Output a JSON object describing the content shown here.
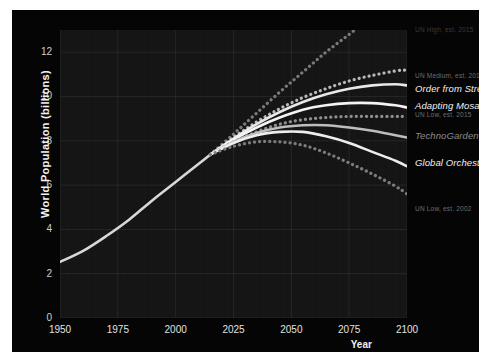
{
  "chart_data": {
    "type": "line",
    "title": "",
    "xlabel": "Year",
    "ylabel": "World Population (billions)",
    "xlim": [
      1950,
      2100
    ],
    "ylim": [
      0,
      13
    ],
    "xticks": [
      1950,
      1975,
      2000,
      2025,
      2050,
      2075,
      2100
    ],
    "yticks": [
      0,
      2,
      4,
      6,
      8,
      10,
      12
    ],
    "grid": true,
    "legend_position": "right-inline-at-line-ends",
    "x": [
      1950,
      1960,
      1970,
      1980,
      1990,
      2000,
      2010,
      2020,
      2030,
      2040,
      2050,
      2060,
      2070,
      2080,
      2090,
      2100
    ],
    "series": [
      {
        "name": "Historical",
        "style": "solid",
        "color": "#d8d8d8",
        "label": "",
        "x": [
          1950,
          1960,
          1970,
          1980,
          1990,
          2000,
          2010,
          2015
        ],
        "values": [
          2.53,
          3.03,
          3.7,
          4.45,
          5.32,
          6.14,
          6.96,
          7.38
        ]
      },
      {
        "name": "UN High, est. 2015",
        "style": "dotted",
        "color": "#7a7a7a",
        "label": "UN High, est. 2015",
        "x": [
          2015,
          2025,
          2035,
          2045,
          2055,
          2065,
          2075,
          2085,
          2095,
          2100
        ],
        "values": [
          7.38,
          8.3,
          9.25,
          10.2,
          11.1,
          12.0,
          12.8,
          13.6,
          14.3,
          14.6
        ]
      },
      {
        "name": "UN Medium, est. 2015",
        "style": "dotted",
        "color": "#b9b9b9",
        "label": "UN Medium, est. 2015",
        "x": [
          2015,
          2025,
          2035,
          2045,
          2055,
          2065,
          2075,
          2085,
          2095,
          2100
        ],
        "values": [
          7.38,
          8.15,
          8.85,
          9.45,
          9.95,
          10.35,
          10.7,
          10.95,
          11.15,
          11.2
        ]
      },
      {
        "name": "Order from Strength",
        "style": "solid",
        "color": "#e8e8e8",
        "label": "Order from Strength",
        "x": [
          2015,
          2025,
          2035,
          2045,
          2055,
          2065,
          2075,
          2085,
          2095,
          2100
        ],
        "values": [
          7.38,
          8.1,
          8.75,
          9.3,
          9.75,
          10.1,
          10.35,
          10.5,
          10.55,
          10.5
        ]
      },
      {
        "name": "Adapting Mosaic",
        "style": "solid",
        "color": "#f4f4f4",
        "label": "Adapting Mosaic",
        "x": [
          2015,
          2025,
          2035,
          2045,
          2055,
          2065,
          2075,
          2085,
          2095,
          2100
        ],
        "values": [
          7.38,
          8.05,
          8.6,
          9.05,
          9.4,
          9.6,
          9.7,
          9.7,
          9.6,
          9.5
        ]
      },
      {
        "name": "UN Low, est. 2015",
        "style": "dotted",
        "color": "#8f8f8f",
        "label": "UN Low, est. 2015",
        "x": [
          2015,
          2025,
          2035,
          2045,
          2055,
          2065,
          2075,
          2085,
          2095,
          2100
        ],
        "values": [
          7.38,
          7.95,
          8.4,
          8.75,
          8.95,
          9.05,
          9.1,
          9.1,
          9.1,
          9.1
        ]
      },
      {
        "name": "TechnoGarden",
        "style": "solid",
        "color": "#bdbdbd",
        "label": "TechnoGarden",
        "x": [
          2015,
          2025,
          2035,
          2045,
          2055,
          2065,
          2075,
          2085,
          2095,
          2100
        ],
        "values": [
          7.38,
          7.95,
          8.35,
          8.6,
          8.7,
          8.7,
          8.6,
          8.45,
          8.25,
          8.15
        ]
      },
      {
        "name": "Global Orchestration",
        "style": "solid",
        "color": "#ededed",
        "label": "Global Orchestration",
        "x": [
          2015,
          2025,
          2035,
          2045,
          2055,
          2065,
          2075,
          2085,
          2095,
          2100
        ],
        "values": [
          7.38,
          7.9,
          8.25,
          8.4,
          8.4,
          8.2,
          7.9,
          7.5,
          7.1,
          6.85
        ]
      },
      {
        "name": "UN Low, est. 2002",
        "style": "dotted",
        "color": "#7c7c7c",
        "label": "UN Low, est. 2002",
        "x": [
          2015,
          2025,
          2035,
          2045,
          2055,
          2065,
          2075,
          2085,
          2095,
          2100
        ],
        "values": [
          7.38,
          7.75,
          7.95,
          7.95,
          7.8,
          7.45,
          7.0,
          6.5,
          5.95,
          5.6
        ]
      }
    ]
  },
  "axes": {
    "ylabel": "World Population (billions)",
    "xlabel": "Year",
    "yticks": [
      "12",
      "10",
      "8",
      "6",
      "4",
      "2",
      "0"
    ],
    "xticks": [
      "1950",
      "1975",
      "2000",
      "2025",
      "2050",
      "2075",
      "2100"
    ]
  },
  "legend": {
    "entries": [
      {
        "label": "UN High, est. 2015",
        "kind": "faint"
      },
      {
        "label": "UN Medium, est. 2015",
        "kind": "un"
      },
      {
        "label": "Order from Strength",
        "kind": "scenario"
      },
      {
        "label": "Adapting Mosaic",
        "kind": "scenario"
      },
      {
        "label": "UN Low, est. 2015",
        "kind": "un"
      },
      {
        "label": "TechnoGarden",
        "kind": "scenario-dim"
      },
      {
        "label": "Global Orchestration",
        "kind": "scenario"
      },
      {
        "label": "UN Low, est. 2002",
        "kind": "un"
      }
    ]
  },
  "colors": {
    "page_background": "#ffffff",
    "figure_background": "#050505",
    "plot_background": "#141414",
    "grid": "#2e2e2e",
    "tick_text": "#d6d6d6",
    "axis_label_text": "#f2f2f2"
  }
}
